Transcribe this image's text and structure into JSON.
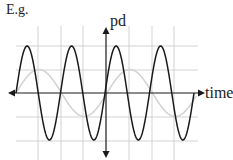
{
  "caption": "E.g.",
  "axes": {
    "y_label": "pd",
    "x_label": "time"
  },
  "colors": {
    "main_wave": "#1a1a1a",
    "reference_wave": "#d4d4d4",
    "grid": "#c8c8c8",
    "axis": "#1a1a1a"
  },
  "chart_data": {
    "type": "line",
    "title": "",
    "xlabel": "time",
    "ylabel": "pd",
    "grid": true,
    "series": [
      {
        "name": "high-frequency signal",
        "shape": "sine",
        "amplitude": 2,
        "cycles_visible": 4,
        "color": "#1a1a1a"
      },
      {
        "name": "reference signal",
        "shape": "sine",
        "amplitude": 1,
        "cycles_visible": 2,
        "color": "#d4d4d4"
      }
    ]
  }
}
